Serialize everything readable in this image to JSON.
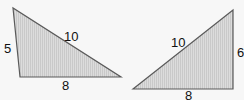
{
  "diagram": {
    "triangles": [
      {
        "name": "left-triangle",
        "points": [
          [
            13,
            8
          ],
          [
            20,
            77
          ],
          [
            121,
            77
          ]
        ],
        "labels": {
          "left_side": "5",
          "hypotenuse": "10",
          "base": "8"
        }
      },
      {
        "name": "right-triangle",
        "points": [
          [
            133,
            89
          ],
          [
            233,
            10
          ],
          [
            233,
            89
          ]
        ],
        "labels": {
          "hypotenuse": "10",
          "right_side": "6",
          "base": "8"
        }
      }
    ],
    "colors": {
      "fill": "#d6d6d6",
      "stroke": "#555555",
      "hatch": "#c4c4c4",
      "background": "#f7f7f7"
    }
  }
}
